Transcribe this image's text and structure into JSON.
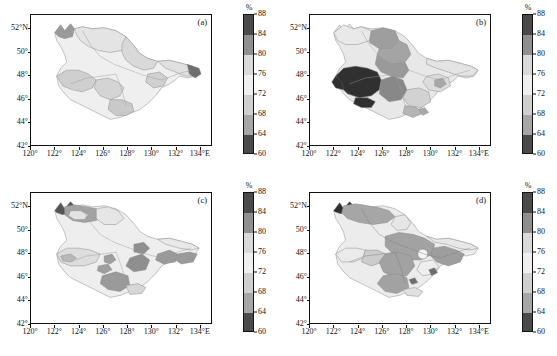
{
  "figure": {
    "panel_count": 4,
    "unit_label": "%"
  },
  "axes": {
    "x_ticks": [
      "120°",
      "122°",
      "124°",
      "126°",
      "128°",
      "130°",
      "132°",
      "134°E"
    ],
    "x_values": [
      120,
      122,
      124,
      126,
      128,
      130,
      132,
      134
    ],
    "y_ticks": [
      "42°",
      "44°",
      "46°",
      "48°",
      "50°",
      "52°N"
    ],
    "y_values": [
      42,
      44,
      46,
      48,
      50,
      52
    ],
    "xlim": [
      120,
      135
    ],
    "ylim": [
      42,
      53.2
    ]
  },
  "colorbar": {
    "unit": "%",
    "tick_labels": [
      "88",
      "84",
      "80",
      "76",
      "72",
      "68",
      "64",
      "60"
    ],
    "tick_values": [
      88,
      84,
      80,
      76,
      72,
      68,
      64,
      60
    ],
    "vmin": 60,
    "vmax": 88,
    "bands": [
      {
        "range": [
          84,
          88
        ],
        "color": "#4a4a4a"
      },
      {
        "range": [
          80,
          84
        ],
        "color": "#8f8f8f"
      },
      {
        "range": [
          76,
          80
        ],
        "color": "#d9d9d9"
      },
      {
        "range": [
          72,
          76
        ],
        "color": "#efefef"
      },
      {
        "range": [
          68,
          72
        ],
        "color": "#cfcfcf"
      },
      {
        "range": [
          64,
          68
        ],
        "color": "#a6a6a6"
      },
      {
        "range": [
          60,
          64
        ],
        "color": "#4a4a4a"
      }
    ]
  },
  "panels": [
    {
      "id": "a",
      "label": "(a)",
      "description": "Mostly light shading, values largely in the 72-80 percent range with scattered 68-72 patches in the south and a dark 60-64 sliver on the far eastern edge."
    },
    {
      "id": "b",
      "label": "(b)",
      "description": "Very dark 60-64 percent region over the western plain near 122-125 E / 45.5-48 N, medium grey 64-72 belt surrounding it, light 72-80 elsewhere."
    },
    {
      "id": "c",
      "label": "(c)",
      "description": "Predominantly light 72-80 percent with isolated medium grey 64-72 patches in the central and south-central areas and a small dark patch in the far north-west."
    },
    {
      "id": "d",
      "label": "(d)",
      "description": "Broad medium grey 68-72 percent coverage over the centre and east, a dark 84-88 patch at the extreme north-west, light 76-80 pockets near 130 E / 46-47 N."
    }
  ],
  "chart_data": {
    "type": "heatmap",
    "title": "",
    "xlabel": "",
    "ylabel": "",
    "unit": "%",
    "colorbar_ticks": [
      60,
      64,
      68,
      72,
      76,
      80,
      84,
      88
    ],
    "xlim": [
      120,
      135
    ],
    "ylim": [
      42,
      53.2
    ],
    "x_tick_labels": [
      "120°",
      "122°",
      "124°",
      "126°",
      "128°",
      "130°",
      "132°",
      "134°E"
    ],
    "y_tick_labels": [
      "42°",
      "44°",
      "46°",
      "48°",
      "50°",
      "52°N"
    ],
    "grid": false,
    "legend_position": "right",
    "panels": [
      {
        "label": "(a)",
        "regions": [
          {
            "name": "far-north",
            "value": 78
          },
          {
            "name": "north-central",
            "value": 77
          },
          {
            "name": "north-east",
            "value": 75
          },
          {
            "name": "west-plain",
            "value": 71
          },
          {
            "name": "central",
            "value": 74
          },
          {
            "name": "south-central",
            "value": 70
          },
          {
            "name": "south-east",
            "value": 73
          },
          {
            "name": "far-east-edge",
            "value": 62
          }
        ]
      },
      {
        "label": "(b)",
        "regions": [
          {
            "name": "far-north",
            "value": 78
          },
          {
            "name": "north-central",
            "value": 70
          },
          {
            "name": "north-east",
            "value": 76
          },
          {
            "name": "west-plain",
            "value": 62
          },
          {
            "name": "west-central",
            "value": 66
          },
          {
            "name": "central",
            "value": 74
          },
          {
            "name": "south-central",
            "value": 70
          },
          {
            "name": "south-east",
            "value": 75
          }
        ]
      },
      {
        "label": "(c)",
        "regions": [
          {
            "name": "far-north-west-patch",
            "value": 62
          },
          {
            "name": "north-ridge",
            "value": 70
          },
          {
            "name": "north-central",
            "value": 77
          },
          {
            "name": "west-plain",
            "value": 75
          },
          {
            "name": "central-patches",
            "value": 70
          },
          {
            "name": "south-central",
            "value": 69
          },
          {
            "name": "east",
            "value": 74
          },
          {
            "name": "south-east",
            "value": 70
          }
        ]
      },
      {
        "label": "(d)",
        "regions": [
          {
            "name": "far-north-west-patch",
            "value": 86
          },
          {
            "name": "north-ridge",
            "value": 70
          },
          {
            "name": "north-central",
            "value": 77
          },
          {
            "name": "west-plain",
            "value": 76
          },
          {
            "name": "central",
            "value": 70
          },
          {
            "name": "east",
            "value": 70
          },
          {
            "name": "east-pocket",
            "value": 78
          },
          {
            "name": "south-central",
            "value": 70
          },
          {
            "name": "south-pocket",
            "value": 77
          }
        ]
      }
    ]
  }
}
